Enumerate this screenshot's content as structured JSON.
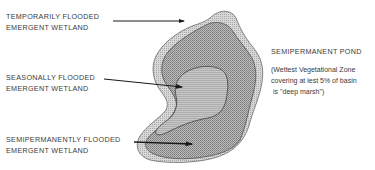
{
  "diagram": {
    "type": "wetland-zonation-cross-section-plan",
    "labels": [
      {
        "id": "temporarily",
        "line1": "TEMPORARILY FLOODED",
        "line2": "EMERGENT WETLAND"
      },
      {
        "id": "seasonally",
        "line1": "SEASONALLY FLOODED",
        "line2": "EMERGENT WETLAND"
      },
      {
        "id": "semipermanently",
        "line1": "SEMIPERMANENTLY FLOODED",
        "line2": "EMERGENT WETLAND"
      }
    ],
    "title": "SEMIPERMANENT POND",
    "note": {
      "line1": "(Wettest Vegetational Zone",
      "line2": "covering at lest 5% of basin",
      "line3": "is \"deep marsh\")"
    },
    "zones": [
      {
        "name": "temporarily-flooded",
        "fill": "#d9d9d9"
      },
      {
        "name": "seasonally-flooded",
        "fill": "#b8b8b8"
      },
      {
        "name": "semipermanently-flooded",
        "fill": "#c9c9c9"
      }
    ],
    "arrow_color": "#1a1a1a"
  }
}
